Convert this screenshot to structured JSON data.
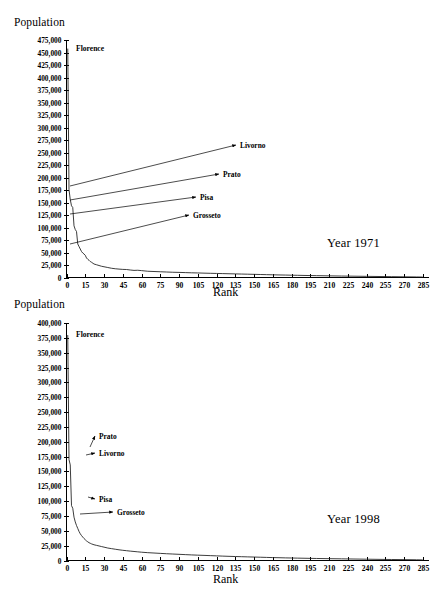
{
  "figure": {
    "charts": [
      {
        "id": "chart-1971",
        "year_label": "Year 1971",
        "ylabel": "Population",
        "xlabel": "Rank",
        "florence_label": "Florence",
        "yticks": [
          "0",
          "25,000",
          "50,000",
          "75,000",
          "100,000",
          "125,000",
          "150,000",
          "175,000",
          "200,000",
          "225,000",
          "250,000",
          "275,000",
          "300,000",
          "325,000",
          "350,000",
          "375,000",
          "400,000",
          "425,000",
          "450,000",
          "475,000"
        ],
        "xticks": [
          "0",
          "15",
          "30",
          "45",
          "60",
          "75",
          "90",
          "105",
          "120",
          "135",
          "150",
          "165",
          "180",
          "195",
          "210",
          "225",
          "240",
          "255",
          "270",
          "285"
        ],
        "annotations": [
          {
            "name": "Livorno",
            "label": "Livorno"
          },
          {
            "name": "Prato",
            "label": "Prato"
          },
          {
            "name": "Pisa",
            "label": "Pisa"
          },
          {
            "name": "Grosseto",
            "label": "Grosseto"
          }
        ]
      },
      {
        "id": "chart-1998",
        "year_label": "Year 1998",
        "ylabel": "Population",
        "xlabel": "Rank",
        "florence_label": "Florence",
        "yticks": [
          "0",
          "25,000",
          "50,000",
          "75,000",
          "100,000",
          "125,000",
          "150,000",
          "175,000",
          "200,000",
          "225,000",
          "250,000",
          "275,000",
          "300,000",
          "325,000",
          "350,000",
          "375,000",
          "400,000"
        ],
        "xticks": [
          "0",
          "15",
          "30",
          "45",
          "60",
          "75",
          "90",
          "105",
          "120",
          "135",
          "150",
          "165",
          "180",
          "195",
          "210",
          "225",
          "240",
          "255",
          "270",
          "285"
        ],
        "annotations": [
          {
            "name": "Prato",
            "label": "Prato"
          },
          {
            "name": "Livorno",
            "label": "Livorno"
          },
          {
            "name": "Pisa",
            "label": "Pisa"
          },
          {
            "name": "Grosseto",
            "label": "Grosseto"
          }
        ]
      }
    ]
  },
  "chart_data": [
    {
      "type": "line",
      "title": "Year 1971",
      "xlabel": "Rank",
      "ylabel": "Population",
      "xlim": [
        0,
        290
      ],
      "ylim": [
        0,
        475000
      ],
      "ytick_step": 25000,
      "xtick_step": 15,
      "grid": false,
      "legend": "none",
      "annotations": [
        {
          "label": "Florence",
          "rank": 1,
          "population": 457803
        },
        {
          "label": "Livorno",
          "rank": 2,
          "population": 175741
        },
        {
          "label": "Prato",
          "rank": 3,
          "population": 143420
        },
        {
          "label": "Pisa",
          "rank": 4,
          "population": 103422
        },
        {
          "label": "Grosseto",
          "rank": 6,
          "population": 67063
        }
      ],
      "series": [
        {
          "name": "1971 Tuscan municipality population by rank",
          "x": [
            1,
            2,
            3,
            4,
            5,
            6,
            7,
            8,
            9,
            10,
            11,
            12,
            13,
            14,
            15,
            16,
            17,
            18,
            19,
            20,
            22,
            24,
            26,
            28,
            30,
            33,
            36,
            39,
            42,
            45,
            48,
            51,
            54,
            57,
            60,
            65,
            70,
            75,
            80,
            85,
            90,
            95,
            100,
            105,
            110,
            115,
            120,
            125,
            130,
            135,
            140,
            145,
            150,
            155,
            160,
            165,
            170,
            175,
            180,
            185,
            190,
            195,
            200,
            210,
            220,
            230,
            240,
            250,
            260,
            270,
            280,
            285
          ],
          "y": [
            457803,
            175741,
            156000,
            143420,
            140000,
            103422,
            96000,
            92000,
            67063,
            62000,
            57000,
            52000,
            49000,
            47000,
            44500,
            39000,
            36500,
            34500,
            32000,
            30500,
            27000,
            25500,
            24000,
            22500,
            21500,
            20000,
            18500,
            17500,
            16800,
            16200,
            16000,
            15000,
            14200,
            14500,
            13800,
            12500,
            12000,
            11500,
            11000,
            10500,
            10200,
            9800,
            9400,
            9100,
            8700,
            8400,
            8100,
            7800,
            7500,
            7200,
            6900,
            6600,
            6300,
            6000,
            5700,
            5400,
            5100,
            4900,
            4600,
            4400,
            4100,
            3900,
            3700,
            3300,
            2900,
            2600,
            2300,
            2000,
            1700,
            1400,
            1100,
            900
          ]
        }
      ]
    },
    {
      "type": "line",
      "title": "Year 1998",
      "xlabel": "Rank",
      "ylabel": "Population",
      "xlim": [
        0,
        290
      ],
      "ylim": [
        0,
        400000
      ],
      "ytick_step": 25000,
      "xtick_step": 15,
      "grid": false,
      "legend": "none",
      "annotations": [
        {
          "label": "Florence",
          "rank": 1,
          "population": 379687
        },
        {
          "label": "Prato",
          "rank": 2,
          "population": 170000
        },
        {
          "label": "Livorno",
          "rank": 3,
          "population": 161000
        },
        {
          "label": "Pisa",
          "rank": 4,
          "population": 92379
        },
        {
          "label": "Grosseto",
          "rank": 6,
          "population": 73000
        }
      ],
      "series": [
        {
          "name": "1998 Tuscan municipality population by rank",
          "x": [
            1,
            2,
            3,
            4,
            5,
            6,
            7,
            8,
            9,
            10,
            11,
            12,
            13,
            14,
            15,
            16,
            17,
            18,
            19,
            20,
            22,
            24,
            26,
            28,
            30,
            33,
            36,
            39,
            42,
            45,
            48,
            51,
            54,
            57,
            60,
            65,
            70,
            75,
            80,
            85,
            90,
            95,
            100,
            105,
            110,
            115,
            120,
            125,
            130,
            135,
            140,
            145,
            150,
            155,
            160,
            165,
            170,
            175,
            180,
            185,
            190,
            195,
            200,
            210,
            220,
            230,
            240,
            250,
            260,
            270,
            280,
            285
          ],
          "y": [
            379687,
            170000,
            161000,
            92379,
            88000,
            73000,
            65000,
            59000,
            54000,
            49000,
            45000,
            42000,
            39500,
            37000,
            35000,
            33000,
            31500,
            30000,
            29000,
            28000,
            26500,
            25500,
            24500,
            23500,
            22500,
            21000,
            20000,
            19000,
            18000,
            17200,
            16500,
            15800,
            15200,
            14600,
            14000,
            13200,
            12600,
            12000,
            11400,
            10900,
            10400,
            9900,
            9400,
            9000,
            8600,
            8200,
            7800,
            7400,
            7000,
            6700,
            6400,
            6100,
            5800,
            5500,
            5200,
            4900,
            4700,
            4400,
            4200,
            4000,
            3800,
            3600,
            3400,
            3100,
            2800,
            2500,
            2200,
            1900,
            1700,
            1500,
            1200,
            1000
          ]
        }
      ]
    }
  ]
}
